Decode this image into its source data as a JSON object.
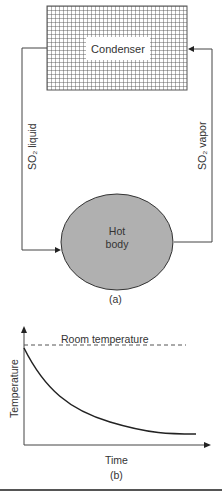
{
  "figure_a": {
    "condenser_label": "Condenser",
    "hot_body_line1": "Hot",
    "hot_body_line2": "body",
    "left_pipe_label": "SO₂ liquid",
    "right_pipe_label": "SO₂ vapor",
    "caption": "(a)"
  },
  "figure_b": {
    "reference_line_label": "Room temperature",
    "ylabel": "Temperature",
    "xlabel": "Time",
    "caption": "(b)"
  },
  "colors": {
    "grid": "#555555",
    "hot_body_fill": "#b0b0b0",
    "line": "#333333"
  }
}
